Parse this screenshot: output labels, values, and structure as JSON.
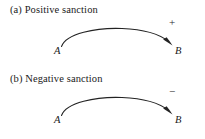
{
  "figure": {
    "width": 205,
    "height": 139,
    "background_color": "#ffffff",
    "ink_color": "#232323"
  },
  "panels": [
    {
      "id": "a",
      "caption": "(a) Positive sanction",
      "source_label": "A",
      "target_label": "B",
      "sign_label": "+",
      "sign_name": "plus-sign",
      "relation": "positive-sanction-arrow"
    },
    {
      "id": "b",
      "caption": "(b) Negative sanction",
      "source_label": "A",
      "target_label": "B",
      "sign_label": "−",
      "sign_name": "minus-sign",
      "relation": "negative-sanction-arrow"
    }
  ]
}
